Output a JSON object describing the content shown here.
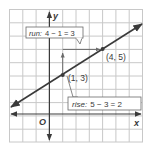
{
  "diagram": {
    "type": "coordinate-graph-slope",
    "axes": {
      "x_label": "x",
      "y_label": "y",
      "origin_label": "O"
    },
    "points": [
      {
        "label": "(1, 3)",
        "x": 1,
        "y": 3
      },
      {
        "label": "(4, 5)",
        "x": 4,
        "y": 5
      }
    ],
    "callouts": {
      "run": {
        "term": "run:",
        "expr": "4 − 1 = 3"
      },
      "rise": {
        "term": "rise:",
        "expr": "5 − 3 = 2"
      }
    },
    "grid": {
      "x_min": -3,
      "x_max": 7,
      "y_min": -2,
      "y_max": 8
    },
    "colors": {
      "line": "#3a3a3a",
      "grid": "#c8c8c8",
      "axis": "#3a3a3a",
      "point": "#3a3a3a"
    }
  }
}
